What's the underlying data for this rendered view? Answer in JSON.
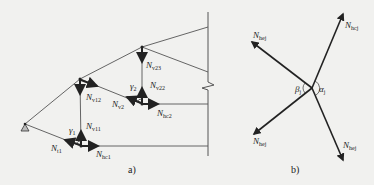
{
  "figure_a": {
    "caption": "a)",
    "labels": {
      "nv23": {
        "main": "N",
        "sub": "v23"
      },
      "nv22": {
        "main": "N",
        "sub": "v22"
      },
      "nv12": {
        "main": "N",
        "sub": "v12"
      },
      "nv2": {
        "main": "N",
        "sub": "v2"
      },
      "nhc2": {
        "main": "N",
        "sub": "hc2"
      },
      "gamma2": {
        "main": "γ",
        "sub": "2"
      },
      "gamma1": {
        "main": "γ",
        "sub": "1"
      },
      "nv11": {
        "main": "N",
        "sub": "v11"
      },
      "nt1": {
        "main": "N",
        "sub": "t1"
      },
      "nhc1": {
        "main": "N",
        "sub": "hc1"
      }
    }
  },
  "figure_b": {
    "caption": "b)",
    "labels": {
      "top_left": {
        "main": "N",
        "sub": "hej"
      },
      "top_right": {
        "main": "N",
        "sub": "hcj"
      },
      "bot_left": {
        "main": "N",
        "sub": "hej"
      },
      "bot_right": {
        "main": "N",
        "sub": "hej"
      },
      "beta": {
        "main": "β",
        "sub": "j"
      },
      "alpha": {
        "main": "α",
        "sub": "j"
      }
    }
  },
  "colors": {
    "background": "#f1f1ef",
    "line": "#555555",
    "arrow": "#222222"
  }
}
